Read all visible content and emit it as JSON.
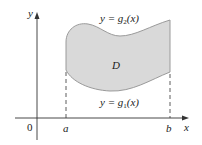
{
  "diagram": {
    "axes": {
      "x_label": "x",
      "y_label": "y",
      "origin_label": "0"
    },
    "bounds": {
      "left_label": "a",
      "right_label": "b"
    },
    "curves": {
      "upper": {
        "label_prefix": "y = g",
        "subscript": "2",
        "label_suffix": "(x)"
      },
      "lower": {
        "label_prefix": "y = g",
        "subscript": "1",
        "label_suffix": "(x)"
      }
    },
    "region_label": "D",
    "colors": {
      "region_fill": "#d9d9d9",
      "region_stroke": "#9a9a9a",
      "axis": "#333333",
      "text": "#1a1a1a"
    }
  }
}
